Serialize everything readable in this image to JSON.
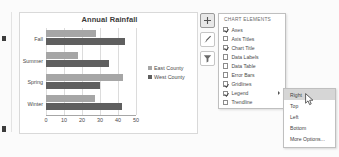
{
  "chart": {
    "title": "Annual Rainfall",
    "legend": {
      "position": "right",
      "entries": [
        "East County",
        "West County"
      ]
    }
  },
  "chart_data": {
    "type": "bar",
    "orientation": "horizontal",
    "title": "Annual Rainfall",
    "categories": [
      "Fall",
      "Summer",
      "Spring",
      "Winter"
    ],
    "series": [
      {
        "name": "East County",
        "color": "#a6a6a6",
        "values": [
          28,
          18,
          43,
          27
        ]
      },
      {
        "name": "West County",
        "color": "#5f5f5f",
        "values": [
          44,
          35,
          30,
          42
        ]
      }
    ],
    "xlabel": "",
    "ylabel": "",
    "xlim": [
      0,
      50
    ],
    "xticks": [
      0,
      10,
      20,
      30,
      40,
      50
    ],
    "xtick_labels": [
      "0",
      "10",
      "20",
      "30",
      "40",
      "50"
    ],
    "grid": true,
    "legend_position": "right"
  },
  "chart_buttons": [
    {
      "name": "chart-elements-button",
      "icon": "plus-icon",
      "active": true
    },
    {
      "name": "chart-styles-button",
      "icon": "brush-icon",
      "active": false
    },
    {
      "name": "chart-filters-button",
      "icon": "filter-icon",
      "active": false
    }
  ],
  "chart_elements_pane": {
    "heading": "CHART ELEMENTS",
    "items": [
      {
        "label": "Axes",
        "checked": true,
        "has_submenu": false
      },
      {
        "label": "Axis Titles",
        "checked": false,
        "has_submenu": false
      },
      {
        "label": "Chart Title",
        "checked": true,
        "has_submenu": false
      },
      {
        "label": "Data Labels",
        "checked": false,
        "has_submenu": false
      },
      {
        "label": "Data Table",
        "checked": false,
        "has_submenu": false
      },
      {
        "label": "Error Bars",
        "checked": false,
        "has_submenu": false
      },
      {
        "label": "Gridlines",
        "checked": true,
        "has_submenu": false
      },
      {
        "label": "Legend",
        "checked": true,
        "has_submenu": true
      },
      {
        "label": "Trendline",
        "checked": false,
        "has_submenu": false
      }
    ]
  },
  "legend_submenu": {
    "items": [
      {
        "label": "Right",
        "highlighted": true
      },
      {
        "label": "Top",
        "highlighted": false
      },
      {
        "label": "Left",
        "highlighted": false
      },
      {
        "label": "Bottom",
        "highlighted": false
      },
      {
        "label": "More Options...",
        "highlighted": false
      }
    ]
  }
}
